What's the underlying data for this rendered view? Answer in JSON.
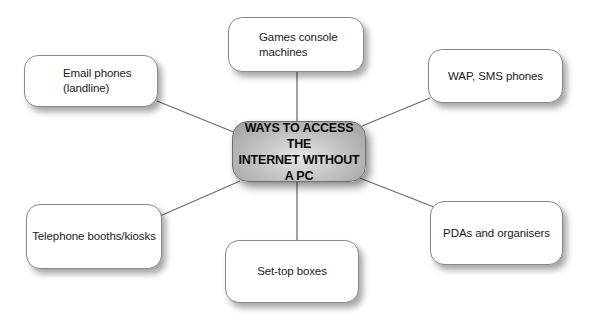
{
  "diagram": {
    "type": "mind-map",
    "center": {
      "label": "WAYS TO ACCESS THE\nINTERNET WITHOUT\nA PC"
    },
    "nodes": [
      {
        "id": "email",
        "label": "Email phones\n(landline)"
      },
      {
        "id": "games",
        "label": "Games console\nmachines"
      },
      {
        "id": "wap",
        "label": "WAP, SMS phones"
      },
      {
        "id": "telephone",
        "label": "Telephone booths/kiosks"
      },
      {
        "id": "settop",
        "label": "Set-top boxes"
      },
      {
        "id": "pda",
        "label": "PDAs and organisers"
      }
    ],
    "edges": [
      {
        "from": "center",
        "to": "email"
      },
      {
        "from": "center",
        "to": "games"
      },
      {
        "from": "center",
        "to": "wap"
      },
      {
        "from": "center",
        "to": "telephone"
      },
      {
        "from": "center",
        "to": "settop"
      },
      {
        "from": "center",
        "to": "pda"
      }
    ],
    "colors": {
      "line": "#6e6e6e",
      "node_border": "#8a8a8a",
      "center_fill": "#b8b8b8",
      "background": "#ffffff"
    }
  }
}
